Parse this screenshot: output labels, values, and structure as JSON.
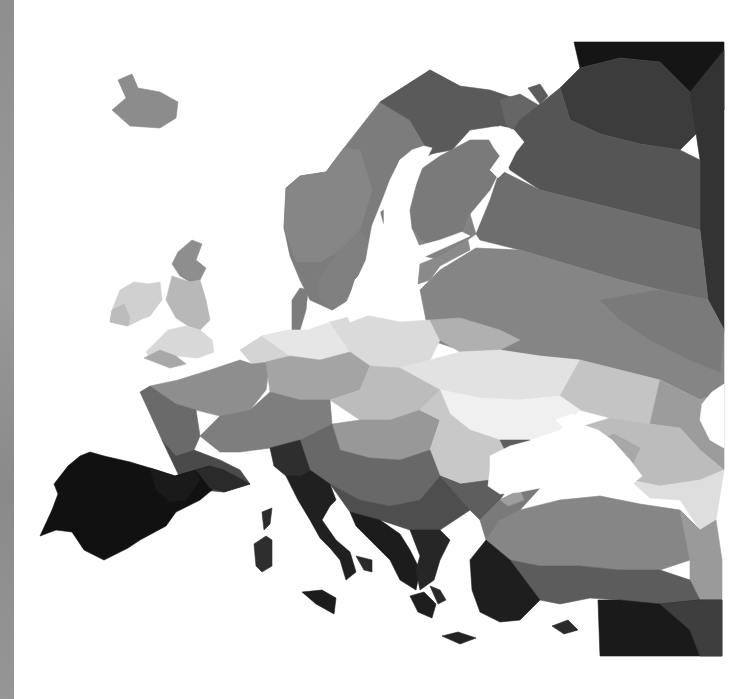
{
  "image": {
    "subject": "Low-poly grayscale map of Europe",
    "background": "#ffffff",
    "left_strip_color": "#909090"
  },
  "regions": [
    {
      "name": "iceland",
      "fill": "#8c8c8c",
      "points": "118,80 132,74 138,88 160,92 178,102 176,118 160,128 130,126 112,110 126,98"
    },
    {
      "name": "scandinavia-west",
      "fill": "#7c7c7c",
      "points": "286,188 300,176 326,172 344,148 380,102 430,70 470,92 460,140 420,160 400,180 390,210 372,246 370,262 354,280 348,300 332,310 310,300 300,280 290,256 284,228"
    },
    {
      "name": "scandinavia-north-dark",
      "fill": "#5a5a5a",
      "points": "380,102 430,70 460,86 490,90 520,100 532,118 516,128 496,126 470,130 452,150 430,154 410,120"
    },
    {
      "name": "norway-mid",
      "fill": "#868686",
      "points": "286,188 300,176 326,172 344,148 360,150 372,190 360,230 340,250 320,262 296,262 284,228"
    },
    {
      "name": "sweden-south",
      "fill": "#808080",
      "points": "340,250 360,230 372,246 370,262 354,280 348,300 332,310 320,300 318,280"
    },
    {
      "name": "finland",
      "fill": "#7a7a7a",
      "points": "410,210 420,170 440,156 470,140 500,140 510,150 500,170 490,190 470,214 460,240 440,250 420,240 412,228"
    },
    {
      "name": "finland-lower",
      "fill": "#838383",
      "points": "412,228 420,240 440,250 460,240 470,214 476,234 440,260 424,256"
    },
    {
      "name": "kola",
      "fill": "#666666",
      "points": "500,100 520,94 540,106 530,130 516,134 506,124"
    },
    {
      "name": "kola-tip",
      "fill": "#5c5c5c",
      "points": "528,88 540,84 548,96 540,104"
    },
    {
      "name": "russia-north-black",
      "fill": "#151515",
      "points": "574,42 724,42 724,110 690,92 660,62 620,58 580,68"
    },
    {
      "name": "russia-north-dark",
      "fill": "#3c3c3c",
      "points": "560,88 580,68 620,58 660,62 690,92 700,130 680,150 640,144 600,134 570,120"
    },
    {
      "name": "russia-northeast",
      "fill": "#333333",
      "points": "690,92 724,50 724,330 708,300 700,230 700,160"
    },
    {
      "name": "russia-mid-dark",
      "fill": "#555555",
      "points": "520,120 560,88 570,120 600,134 640,144 680,150 700,160 700,230 660,220 620,210 580,200 540,190 510,170 500,150"
    },
    {
      "name": "russia-mid",
      "fill": "#6e6e6e",
      "points": "500,170 540,190 580,200 620,210 660,220 700,230 708,300 660,290 620,280 560,262 520,250 480,240 476,234 490,200"
    },
    {
      "name": "russia-central",
      "fill": "#858585",
      "points": "420,290 440,270 476,248 520,250 560,262 620,280 660,290 708,300 724,330 724,390 700,400 660,380 620,370 580,360 540,356 500,350 460,350 430,340"
    },
    {
      "name": "russia-central-lower",
      "fill": "#7a7a7a",
      "points": "600,300 660,290 708,300 724,330 720,372 690,360 650,340 620,320"
    },
    {
      "name": "baltics",
      "fill": "#8a8a8a",
      "points": "420,264 440,256 468,240 470,250 440,266 430,280 418,284"
    },
    {
      "name": "jutland",
      "fill": "#7c7c7c",
      "points": "292,300 300,288 308,290 306,310 300,330 292,330"
    },
    {
      "name": "ireland",
      "fill": "#d0d0d0",
      "points": "120,290 134,282 148,284 160,282 162,300 150,316 140,320 128,326 110,322 112,310"
    },
    {
      "name": "ireland-west",
      "fill": "#bcbcbc",
      "points": "110,322 112,310 124,304 130,318 128,326"
    },
    {
      "name": "britain-north",
      "fill": "#8e8e8e",
      "points": "178,252 192,240 202,244 196,260 206,268 200,280 190,282 180,276 172,264"
    },
    {
      "name": "britain-mid",
      "fill": "#b8b8b8",
      "points": "172,276 190,282 200,280 206,300 210,320 200,330 188,326 176,318 166,300"
    },
    {
      "name": "britain-south",
      "fill": "#d8d8d8",
      "points": "168,330 186,326 200,330 212,340 214,352 198,358 176,356 160,350 150,358 146,352 158,340"
    },
    {
      "name": "cornwall",
      "fill": "#a8a8a8",
      "points": "144,358 160,350 176,356 186,364 170,368"
    },
    {
      "name": "lowcountries",
      "fill": "#d4d4d4",
      "points": "240,350 262,336 290,330 300,340 288,356 270,362 252,364"
    },
    {
      "name": "germany-north",
      "fill": "#e6e6e6",
      "points": "262,336 290,330 308,330 330,322 352,330 350,352 320,360 290,356"
    },
    {
      "name": "poland",
      "fill": "#dadada",
      "points": "330,322 360,314 400,322 430,320 440,340 430,360 400,368 370,366 350,352"
    },
    {
      "name": "belarus",
      "fill": "#b0b0b0",
      "points": "430,320 460,318 500,330 520,340 500,350 460,352 440,340"
    },
    {
      "name": "ukraine-north",
      "fill": "#e2e2e2",
      "points": "400,368 430,360 460,352 500,350 540,356 580,360 600,380 560,396 520,400 480,398 440,390"
    },
    {
      "name": "ukraine-east",
      "fill": "#c4c4c4",
      "points": "580,360 620,370 660,380 700,400 690,420 650,424 610,418 580,410 560,396"
    },
    {
      "name": "russia-south",
      "fill": "#9c9c9c",
      "points": "660,380 700,400 724,390 724,470 700,450 680,428 650,424"
    },
    {
      "name": "ukraine-south",
      "fill": "#f0f0f0",
      "points": "440,390 480,398 520,400 560,396 580,410 560,430 530,440 500,440 470,430 450,414"
    },
    {
      "name": "france-north",
      "fill": "#8e8e8e",
      "points": "150,386 178,380 210,370 240,360 252,364 270,362 266,390 250,410 220,416 196,410 176,404"
    },
    {
      "name": "france-west",
      "fill": "#6a6a6a",
      "points": "140,392 150,386 176,404 196,410 200,436 194,450 176,456 162,440"
    },
    {
      "name": "france-south",
      "fill": "#4a4a4a",
      "points": "162,440 176,456 194,450 220,460 240,470 250,484 224,492 200,490 180,478"
    },
    {
      "name": "germany-south",
      "fill": "#a4a4a4",
      "points": "266,362 290,356 320,360 350,352 370,366 360,390 330,400 300,400 270,392"
    },
    {
      "name": "alps",
      "fill": "#7e7e7e",
      "points": "200,436 220,416 250,410 270,392 300,400 330,400 332,424 300,440 270,448 240,452 220,452"
    },
    {
      "name": "czech-slovakia",
      "fill": "#bcbcbc",
      "points": "330,400 360,390 370,366 400,368 440,390 420,410 390,420 360,420"
    },
    {
      "name": "hungary",
      "fill": "#989898",
      "points": "332,424 360,420 390,420 420,410 440,420 430,450 400,460 370,458 340,450"
    },
    {
      "name": "romania",
      "fill": "#c8c8c8",
      "points": "420,410 440,390 450,414 470,430 500,440 510,460 490,480 460,484 440,476 430,450 440,420"
    },
    {
      "name": "balkans-north",
      "fill": "#686868",
      "points": "300,440 332,424 340,450 370,458 400,460 430,450 440,476 420,500 390,506 360,500 330,484 310,470"
    },
    {
      "name": "balkans-mid",
      "fill": "#4e4e4e",
      "points": "330,484 360,500 390,506 420,500 440,476 460,484 470,510 440,530 410,530 380,520 350,512"
    },
    {
      "name": "bulgaria",
      "fill": "#5e5e5e",
      "points": "440,476 460,484 490,480 510,460 500,440 530,440 520,470 500,500 480,520 470,510"
    },
    {
      "name": "iberia",
      "fill": "#111111",
      "points": "68,466 80,456 90,452 104,456 130,462 150,468 175,476 196,470 210,466 212,490 200,500 176,512 166,526 140,540 128,548 104,560 84,550 72,532 56,530 40,536 52,510 58,494 54,484"
    },
    {
      "name": "iberia-east",
      "fill": "#1a1a1a",
      "points": "150,468 175,476 196,470 200,480 186,500 170,502 156,490"
    },
    {
      "name": "pyrenees",
      "fill": "#2a2a2a",
      "points": "196,470 210,466 224,470 250,484 224,492 210,488"
    },
    {
      "name": "italy-north",
      "fill": "#2e2e2e",
      "points": "270,448 300,440 310,470 300,476 286,476 274,466"
    },
    {
      "name": "italy",
      "fill": "#202020",
      "points": "286,476 300,476 310,470 330,484 336,500 330,506 322,520 336,540 350,552 356,572 346,580 340,560 330,548 320,538 310,520 298,500"
    },
    {
      "name": "italy-heel",
      "fill": "#2a2a2a",
      "points": "356,556 372,560 372,572 364,570"
    },
    {
      "name": "sicily",
      "fill": "#1c1c1c",
      "points": "302,592 322,590 336,598 334,614 316,604"
    },
    {
      "name": "corsica",
      "fill": "#2c2c2c",
      "points": "262,512 272,508 270,524 264,530"
    },
    {
      "name": "sardinia",
      "fill": "#2e2e2e",
      "points": "254,544 266,536 272,540 272,566 262,572 256,566"
    },
    {
      "name": "dalmatia",
      "fill": "#1c1c1c",
      "points": "350,512 380,520 400,534 410,550 420,570 416,590 400,580 390,560 370,540 356,526"
    },
    {
      "name": "greece",
      "fill": "#262626",
      "points": "410,530 440,530 450,540 440,560 434,580 420,590 416,570 420,556"
    },
    {
      "name": "peloponnese",
      "fill": "#1e1e1e",
      "points": "410,596 424,592 436,604 432,618 418,612"
    },
    {
      "name": "aegean-island",
      "fill": "#2a2a2a",
      "points": "430,586 440,590 446,600 438,604"
    },
    {
      "name": "crete",
      "fill": "#232323",
      "points": "442,636 458,632 476,638 460,644"
    },
    {
      "name": "crimea",
      "fill": "#c0c0c0",
      "points": "530,448 548,440 560,450 550,462 536,462"
    },
    {
      "name": "caucasus-north",
      "fill": "#bcbcbc",
      "points": "584,426 610,418 650,424 680,428 700,450 724,470 700,480 660,486 630,480 600,470 590,450"
    },
    {
      "name": "caucasus-light",
      "fill": "#dedede",
      "points": "630,480 660,486 700,480 724,470 716,520 700,530 680,500 650,498"
    },
    {
      "name": "black-sea-rim-east",
      "fill": "#a8a8a8",
      "points": "598,440 614,434 640,448 630,470 610,474"
    },
    {
      "name": "turkey-north",
      "fill": "#868686",
      "points": "486,540 500,520 520,510 560,500 600,496 640,504 680,510 700,530 690,560 660,570 620,570 580,566 540,566 510,560"
    },
    {
      "name": "turkey-east",
      "fill": "#9a9a9a",
      "points": "680,510 700,530 716,520 722,560 722,600 700,600 690,580 690,560"
    },
    {
      "name": "turkey-mid",
      "fill": "#5c5c5c",
      "points": "510,560 540,566 580,566 620,570 660,570 690,580 700,600 660,604 620,600 590,598 560,604 540,600"
    },
    {
      "name": "anatolia-west",
      "fill": "#1e1e1e",
      "points": "470,560 486,540 510,560 540,600 520,620 500,622 480,612 472,590"
    },
    {
      "name": "middle-east-dark",
      "fill": "#1a1a1a",
      "points": "598,600 620,600 660,604 700,600 722,600 722,656 600,656"
    },
    {
      "name": "middle-east-mid",
      "fill": "#3e3e3e",
      "points": "660,604 700,600 722,600 722,656 700,656 690,630"
    },
    {
      "name": "cyprus",
      "fill": "#2a2a2a",
      "points": "552,626 568,620 578,630 564,634"
    },
    {
      "name": "thrace",
      "fill": "#7a7a7a",
      "points": "480,520 500,500 520,490 540,488 520,510 500,520 486,540"
    },
    {
      "name": "bosporus-island",
      "fill": "#9e9e9e",
      "points": "500,500 520,490 524,500 508,506"
    }
  ],
  "water": [
    {
      "name": "black-sea",
      "fill": "#ffffff",
      "points": "490,456 510,446 540,438 560,430 580,424 598,430 612,440 630,460 642,476 630,486 610,490 580,490 560,488 540,488 520,492 500,494 488,486 490,470"
    },
    {
      "name": "sea-of-azov",
      "fill": "#ffffff",
      "points": "556,420 572,414 586,418 580,428 566,430"
    },
    {
      "name": "caspian-notch",
      "fill": "#ffffff",
      "points": "724,384 712,392 702,404 700,420 710,440 724,448"
    },
    {
      "name": "baltic-sea",
      "fill": "#ffffff",
      "points": "380,212 396,200 412,170 428,150 416,150 400,160 390,180 384,196 372,226 366,260 352,290 344,308 350,322 366,316 382,306 388,290 400,274 410,262 426,256 448,246 470,236 462,232 440,240 418,246 404,244 392,240 384,228"
    },
    {
      "name": "gulf-of-bothnia",
      "fill": "#ffffff",
      "points": "400,160 412,150 424,146 432,148 422,168 410,200 400,220 392,236 384,228 384,206"
    },
    {
      "name": "white-sea",
      "fill": "#ffffff",
      "points": "486,134 500,126 514,130 524,142 516,152 508,168 498,178 490,170 500,156 494,148"
    }
  ]
}
